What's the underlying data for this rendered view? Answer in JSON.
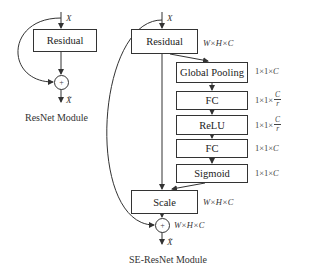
{
  "resnet": {
    "input_label": "X",
    "block_label": "Residual",
    "sum_symbol": "+",
    "output_label": "X̃",
    "caption": "ResNet Module"
  },
  "se_resnet": {
    "input_label": "X",
    "residual_label": "Residual",
    "residual_dim": "W×H×C",
    "stack": [
      {
        "label": "Global Pooling",
        "dim_prefix": "1×1×",
        "dim_var": "C",
        "dim_frac": null
      },
      {
        "label": "FC",
        "dim_prefix": "1×1×",
        "dim_var": null,
        "dim_frac": {
          "num": "C",
          "den": "r"
        }
      },
      {
        "label": "ReLU",
        "dim_prefix": "1×1×",
        "dim_var": null,
        "dim_frac": {
          "num": "C",
          "den": "r"
        }
      },
      {
        "label": "FC",
        "dim_prefix": "1×1×",
        "dim_var": "C",
        "dim_frac": null
      },
      {
        "label": "Sigmoid",
        "dim_prefix": "1×1×",
        "dim_var": "C",
        "dim_frac": null
      }
    ],
    "scale_label": "Scale",
    "scale_dim": "W×H×C",
    "sum_symbol": "+",
    "sum_dim": "W×H×C",
    "output_label": "X̃",
    "caption": "SE-ResNet Module"
  }
}
